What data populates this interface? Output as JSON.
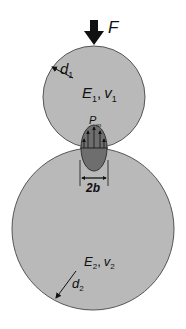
{
  "diagram": {
    "type": "hertz-contact-two-spheres",
    "force": {
      "label": "F",
      "icon": "down-arrow-icon"
    },
    "body1": {
      "diameter_label": "d",
      "diameter_sub": "1",
      "modulus_label": "E",
      "modulus_sub": "1",
      "poisson_label": "v",
      "poisson_sub": "1",
      "separator": ","
    },
    "body2": {
      "diameter_label": "d",
      "diameter_sub": "2",
      "modulus_label": "E",
      "modulus_sub": "2",
      "poisson_label": "v",
      "poisson_sub": "2",
      "separator": ","
    },
    "contact": {
      "pressure_label": "P",
      "pressure_sub": "m",
      "width_label": "2b"
    },
    "colors": {
      "body_fill": "#b9b9b9",
      "body_stroke": "#555555",
      "contact_fill": "#6e6e6e",
      "ink": "#111111"
    }
  }
}
